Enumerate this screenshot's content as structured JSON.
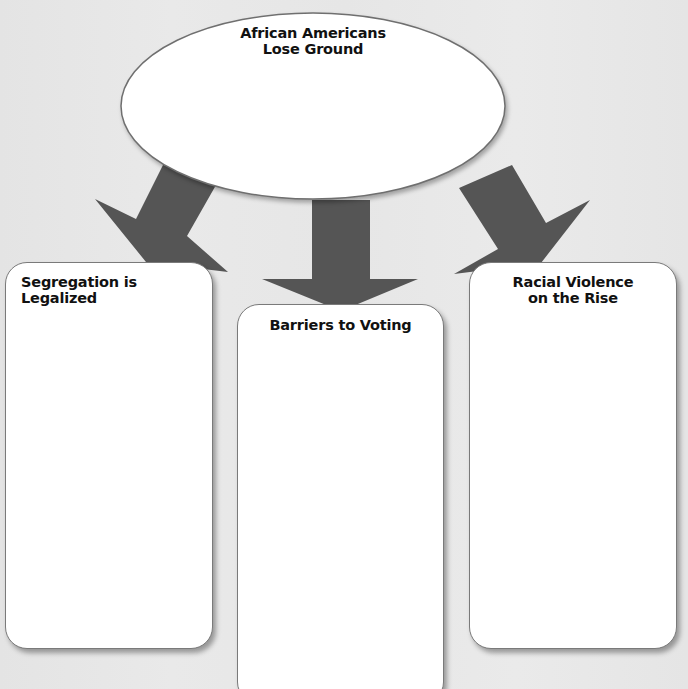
{
  "diagram": {
    "type": "graphic-organizer",
    "colors": {
      "background": "#e7e7e7",
      "arrow": "#555555",
      "box_fill": "#ffffff",
      "outline": "#6f6f6f",
      "text": "#111111"
    },
    "central_node": {
      "title_line1": "African Americans",
      "title_line2": "Lose Ground",
      "content": ""
    },
    "branches": [
      {
        "id": "left",
        "title_line1": "Segregation is Legalized",
        "title_line2": "",
        "content": ""
      },
      {
        "id": "middle",
        "title_line1": "Barriers to Voting",
        "title_line2": "",
        "content": ""
      },
      {
        "id": "right",
        "title_line1": "Racial Violence",
        "title_line2": "on the Rise",
        "content": ""
      }
    ],
    "edges": [
      {
        "from": "central_node",
        "to": "left"
      },
      {
        "from": "central_node",
        "to": "middle"
      },
      {
        "from": "central_node",
        "to": "right"
      }
    ]
  }
}
